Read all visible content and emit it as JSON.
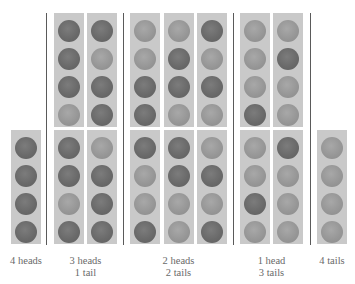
{
  "legend": {
    "H": {
      "meaning": "head",
      "color": "#6a6a6a"
    },
    "T": {
      "meaning": "tail",
      "color": "#979797"
    }
  },
  "groups": [
    {
      "id": "4-heads",
      "label_lines": [
        "4 heads"
      ],
      "count": 1,
      "columns": [
        {
          "bottom": [
            "H",
            "H",
            "H",
            "H"
          ]
        }
      ]
    },
    {
      "id": "3-heads-1-tail",
      "label_lines": [
        "3 heads",
        "1 tail"
      ],
      "count": 4,
      "columns": [
        {
          "top": [
            "H",
            "H",
            "H",
            "T"
          ],
          "bottom": [
            "H",
            "H",
            "T",
            "H"
          ]
        },
        {
          "top": [
            "H",
            "T",
            "H",
            "H"
          ],
          "bottom": [
            "T",
            "H",
            "H",
            "H"
          ]
        }
      ]
    },
    {
      "id": "2-heads-2-tails",
      "label_lines": [
        "2 heads",
        "2 tails"
      ],
      "count": 6,
      "columns": [
        {
          "top": [
            "T",
            "T",
            "H",
            "H"
          ],
          "bottom": [
            "H",
            "T",
            "T",
            "H"
          ]
        },
        {
          "top": [
            "T",
            "H",
            "H",
            "T"
          ],
          "bottom": [
            "H",
            "H",
            "T",
            "T"
          ]
        },
        {
          "top": [
            "H",
            "T",
            "H",
            "T"
          ],
          "bottom": [
            "T",
            "H",
            "T",
            "H"
          ]
        }
      ]
    },
    {
      "id": "1-head-3-tails",
      "label_lines": [
        "1 head",
        "3 tails"
      ],
      "count": 4,
      "columns": [
        {
          "top": [
            "T",
            "T",
            "T",
            "H"
          ],
          "bottom": [
            "T",
            "T",
            "H",
            "T"
          ]
        },
        {
          "top": [
            "T",
            "H",
            "T",
            "T"
          ],
          "bottom": [
            "H",
            "T",
            "T",
            "T"
          ]
        }
      ]
    },
    {
      "id": "4-tails",
      "label_lines": [
        "4 tails"
      ],
      "count": 1,
      "columns": [
        {
          "bottom": [
            "T",
            "T",
            "T",
            "T"
          ]
        }
      ]
    }
  ]
}
